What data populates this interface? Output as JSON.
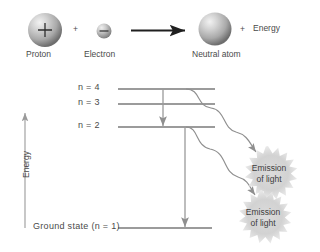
{
  "figure": {
    "colors": {
      "line": "#7a7a7a",
      "text": "#4a4a4a",
      "sphere_light": "#e6e6e6",
      "sphere_mid": "#b5b5b5",
      "sphere_dark": "#6f6f6f",
      "burst": "#d9d9d9",
      "arrow": "#8a8a8a",
      "reaction_arrow": "#1f1f1f"
    }
  },
  "reaction": {
    "proton": {
      "label": "Proton",
      "charge": "+"
    },
    "plus_1": "+",
    "electron": {
      "label": "Electron",
      "charge": "–"
    },
    "arrow": "reaction-arrow",
    "product": {
      "label": "Neutral atom"
    },
    "plus_2": "+",
    "energy_label": "Energy"
  },
  "energy_axis": {
    "label": "Energy",
    "direction": "up"
  },
  "levels": [
    {
      "id": "n4",
      "label": "n = 4",
      "y": 89
    },
    {
      "id": "n3",
      "label": "n = 3",
      "y": 104
    },
    {
      "id": "n2",
      "label": "n = 2",
      "y": 127
    },
    {
      "id": "n1",
      "label": "Ground state (n = 1)",
      "y": 228
    }
  ],
  "transitions": [
    {
      "id": "t-4-to-2",
      "from": "n = 4",
      "to": "n = 2"
    },
    {
      "id": "t-2-to-1",
      "from": "n = 2",
      "to": "Ground state (n = 1)"
    }
  ],
  "emissions": [
    {
      "id": "emission-upper",
      "line1": "Emission",
      "line2": "of light"
    },
    {
      "id": "emission-lower",
      "line1": "Emission",
      "line2": "of light"
    }
  ]
}
